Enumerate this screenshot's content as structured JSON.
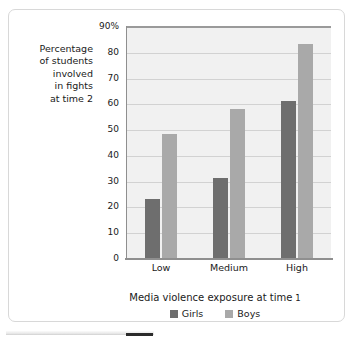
{
  "figure": {
    "y_axis_caption_lines": [
      "Percentage",
      "of students",
      "involved",
      "in fights",
      "at time 2"
    ]
  },
  "chart_data": {
    "type": "bar",
    "title": "",
    "xlabel_prefix": "Media violence exposure at time",
    "xlabel_suffix": "1",
    "xlabel": "Media violence exposure at time 1",
    "ylabel": "Percentage of students involved in fights at time 2",
    "categories": [
      "Low",
      "Medium",
      "High"
    ],
    "series": [
      {
        "name": "Girls",
        "color": "#6e6e6e",
        "values": [
          23,
          31,
          61
        ]
      },
      {
        "name": "Boys",
        "color": "#a9a9a9",
        "values": [
          48,
          58,
          83
        ]
      }
    ],
    "ylim": [
      0,
      90
    ],
    "ytick_values": [
      90,
      80,
      70,
      60,
      50,
      40,
      30,
      20,
      10,
      0
    ],
    "ytick_labels": [
      "90%",
      "80",
      "70",
      "60",
      "50",
      "40",
      "30",
      "20",
      "10",
      "0"
    ],
    "grid": true,
    "legend_position": "bottom"
  }
}
